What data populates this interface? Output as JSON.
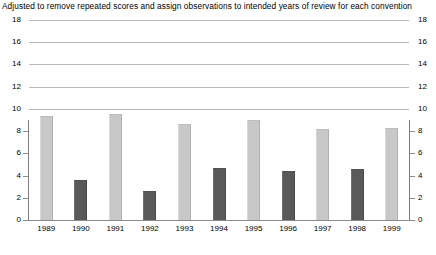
{
  "chart_data": {
    "type": "bar",
    "title": "Adjusted to remove repeated scores and assign observations to intended years of review for each convention",
    "xlabel": "",
    "ylabel": "",
    "categories": [
      "1989",
      "1990",
      "1991",
      "1992",
      "1993",
      "1994",
      "1995",
      "1996",
      "1997",
      "1998",
      "1999"
    ],
    "values": [
      9.4,
      3.6,
      9.5,
      2.6,
      8.6,
      4.7,
      9.0,
      4.4,
      8.2,
      4.6,
      8.3
    ],
    "bar_shades": [
      "light",
      "dark",
      "light",
      "dark",
      "light",
      "dark",
      "light",
      "dark",
      "light",
      "dark",
      "light"
    ],
    "ylim": [
      0,
      18
    ],
    "ytick_step": 2,
    "yticks": [
      18,
      16,
      14,
      12,
      10,
      8,
      6,
      4,
      2,
      0
    ],
    "ytick_labels_left": [
      "18",
      "16",
      "14",
      "12",
      "10",
      "8",
      "6",
      "4",
      "2",
      "0"
    ],
    "ytick_labels_right": [
      "18",
      "16",
      "14",
      "12",
      "10",
      "8",
      "6",
      "4",
      "2",
      "0"
    ],
    "grid": "horizontal",
    "gridline_full_width_above": 10,
    "legend": "none",
    "colors": {
      "bar_light": "#c8c8c8",
      "bar_dark": "#595959",
      "gridline": "#b9b9b9",
      "axis": "#8c8c8c",
      "text": "#000000",
      "background": "#ffffff"
    }
  }
}
